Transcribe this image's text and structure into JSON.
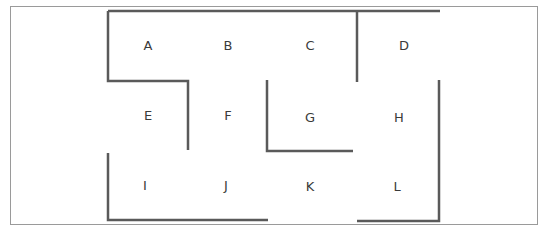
{
  "diagram": {
    "type": "maze-floorplan",
    "colors": {
      "wall": "#5a5a5a",
      "frame": "#9a9a9a",
      "label": "#3a3a3a",
      "background": "#ffffff"
    },
    "cells": [
      {
        "id": "A",
        "label": "A",
        "x": 148,
        "y": 46
      },
      {
        "id": "B",
        "label": "B",
        "x": 228,
        "y": 46
      },
      {
        "id": "C",
        "label": "C",
        "x": 310,
        "y": 46
      },
      {
        "id": "D",
        "label": "D",
        "x": 404,
        "y": 46
      },
      {
        "id": "E",
        "label": "E",
        "x": 148,
        "y": 116
      },
      {
        "id": "F",
        "label": "F",
        "x": 228,
        "y": 116
      },
      {
        "id": "G",
        "label": "G",
        "x": 310,
        "y": 118
      },
      {
        "id": "H",
        "label": "H",
        "x": 399,
        "y": 118
      },
      {
        "id": "I",
        "label": "I",
        "x": 145,
        "y": 186
      },
      {
        "id": "J",
        "label": "J",
        "x": 226,
        "y": 186
      },
      {
        "id": "K",
        "label": "K",
        "x": 310,
        "y": 187
      },
      {
        "id": "L",
        "label": "L",
        "x": 397,
        "y": 187
      }
    ],
    "walls": [
      {
        "name": "top-wall",
        "points": "108,11 440,11"
      },
      {
        "name": "a-left-e-top-wall",
        "points": "108,11 108,81 188,81 188,150"
      },
      {
        "name": "c-d-divider-wall",
        "points": "357,11 357,82"
      },
      {
        "name": "g-left-bottom-wall",
        "points": "267,80 267,151 353,151"
      },
      {
        "name": "h-l-right-bottom-wall",
        "points": "439,80 439,221 357,221"
      },
      {
        "name": "i-left-bottom-wall",
        "points": "108,153 108,220 268,220"
      }
    ]
  }
}
